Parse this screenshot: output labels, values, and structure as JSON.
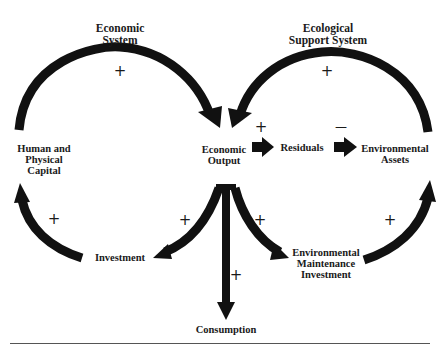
{
  "diagram": {
    "titles": {
      "economic_system": [
        "Economic",
        "System"
      ],
      "ecological_support_system": [
        "Ecological",
        "Support System"
      ]
    },
    "nodes": {
      "human_physical_capital": [
        "Human and",
        "Physical",
        "Capital"
      ],
      "economic_output": [
        "Economic",
        "Output"
      ],
      "residuals": [
        "Residuals"
      ],
      "environmental_assets": [
        "Environmental",
        "Assets"
      ],
      "investment": [
        "Investment"
      ],
      "environmental_maintenance_investment": [
        "Environmental",
        "Maintenance",
        "Investment"
      ],
      "consumption": [
        "Consumption"
      ]
    },
    "signs": {
      "economic_loop": "+",
      "ecological_loop": "+",
      "output_to_residuals": "+",
      "residuals_to_assets": "—",
      "investment_to_capital": "+",
      "output_to_investment": "+",
      "output_to_env_maintenance": "+",
      "env_maintenance_to_assets": "+",
      "output_to_consumption": "+"
    },
    "edges": [
      {
        "from": "Human and Physical Capital",
        "to": "Economic Output",
        "sign": "+"
      },
      {
        "from": "Environmental Assets",
        "to": "Economic Output",
        "sign": "+"
      },
      {
        "from": "Economic Output",
        "to": "Residuals",
        "sign": "+"
      },
      {
        "from": "Residuals",
        "to": "Environmental Assets",
        "sign": "-"
      },
      {
        "from": "Economic Output",
        "to": "Investment",
        "sign": "+"
      },
      {
        "from": "Investment",
        "to": "Human and Physical Capital",
        "sign": "+"
      },
      {
        "from": "Economic Output",
        "to": "Environmental Maintenance Investment",
        "sign": "+"
      },
      {
        "from": "Environmental Maintenance Investment",
        "to": "Environmental Assets",
        "sign": "+"
      },
      {
        "from": "Economic Output",
        "to": "Consumption",
        "sign": "+"
      }
    ],
    "colors": {
      "ink": "#111111",
      "background": "#ffffff"
    }
  }
}
